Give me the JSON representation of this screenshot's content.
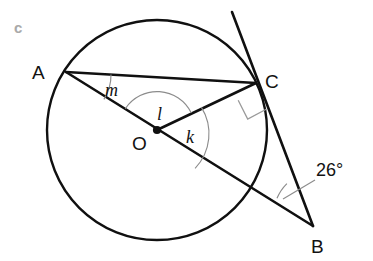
{
  "figure": {
    "part_label": "c",
    "points": {
      "A": "A",
      "B": "B",
      "C": "C",
      "O": "O"
    },
    "angles": {
      "m": "m",
      "l": "l",
      "k": "k",
      "b": "26°"
    },
    "colors": {
      "stroke": "#101010",
      "arc": "#8c8c8c",
      "right_angle": "#9a9a9a",
      "part_label": "#a9a9a9",
      "background": "#ffffff"
    },
    "icons": {
      "right_angle": "right-angle-marker",
      "center_dot": "center-point-dot"
    }
  }
}
